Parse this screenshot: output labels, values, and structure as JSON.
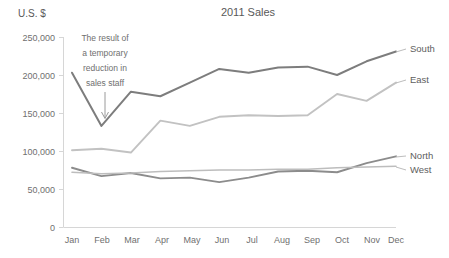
{
  "chart_data": {
    "type": "line",
    "title": "2011 Sales",
    "ylabel": "U.S. $",
    "xlabel": "",
    "categories": [
      "Jan",
      "Feb",
      "Mar",
      "Apr",
      "May",
      "Jun",
      "Jul",
      "Aug",
      "Sep",
      "Oct",
      "Nov",
      "Dec"
    ],
    "ylim": [
      0,
      250000
    ],
    "ytick_values": [
      0,
      50000,
      100000,
      150000,
      200000,
      250000
    ],
    "ytick_labels": [
      "0",
      "50,000",
      "100,000",
      "150,000",
      "200,000",
      "250,000"
    ],
    "grid": false,
    "legend_position": "right-end-of-line",
    "series": [
      {
        "name": "South",
        "color": "#7d7d7d",
        "width": 2.0,
        "values": [
          203000,
          133000,
          178000,
          172000,
          190000,
          208000,
          203000,
          210000,
          211000,
          200000,
          218000,
          231000
        ]
      },
      {
        "name": "East",
        "color": "#c2c2c2",
        "width": 1.9,
        "values": [
          101000,
          103000,
          98000,
          140000,
          133000,
          145000,
          147000,
          146000,
          147000,
          175000,
          166000,
          190000
        ]
      },
      {
        "name": "North",
        "color": "#8c8c8c",
        "width": 1.9,
        "values": [
          78000,
          67000,
          71000,
          64000,
          65000,
          59000,
          65000,
          73000,
          74000,
          72000,
          84000,
          93000
        ]
      },
      {
        "name": "West",
        "color": "#bdbdbd",
        "width": 1.6,
        "values": [
          72000,
          70000,
          71000,
          73000,
          74000,
          75000,
          75000,
          76000,
          76000,
          78000,
          79000,
          80000
        ]
      }
    ],
    "annotations": [
      {
        "name": "sales-staff-note",
        "lines": [
          "The result of",
          "a temporary",
          "reduction in",
          "sales staff"
        ],
        "target_category": "Feb",
        "target_value": 133000
      }
    ]
  }
}
